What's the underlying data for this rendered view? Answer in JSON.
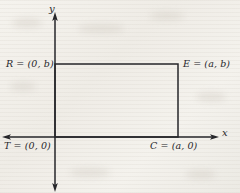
{
  "figure": {
    "background_color": "#f3f1ec",
    "line_color": "#26262a"
  },
  "axes": {
    "x_label": "x",
    "y_label": "y",
    "x_axis": {
      "y": 137,
      "x_start": 5,
      "x_end": 215,
      "arrow_left": true,
      "arrow_right": true
    },
    "y_axis": {
      "x": 55,
      "y_start": 16,
      "y_end": 188,
      "arrow_up": true,
      "arrow_down": true
    }
  },
  "shape": {
    "type": "rectangle",
    "left": 55,
    "top": 64,
    "right": 178,
    "bottom": 137,
    "width": 123,
    "height": 73
  },
  "vertices": [
    {
      "id": "R",
      "label": "R = (0, b)",
      "point": "(0, b)",
      "px": {
        "x": 55,
        "y": 64
      }
    },
    {
      "id": "E",
      "label": "E = (a, b)",
      "point": "(a, b)",
      "px": {
        "x": 178,
        "y": 64
      }
    },
    {
      "id": "T",
      "label": "T = (0, 0)",
      "point": "(0, 0)",
      "px": {
        "x": 55,
        "y": 137
      }
    },
    {
      "id": "C",
      "label": "C = (a, 0)",
      "point": "(a, 0)",
      "px": {
        "x": 178,
        "y": 137
      }
    }
  ]
}
